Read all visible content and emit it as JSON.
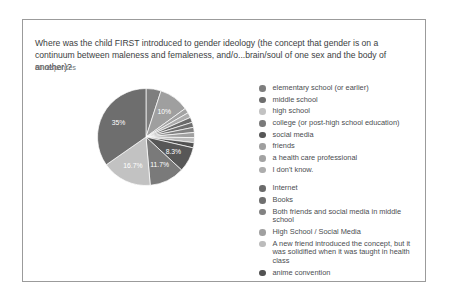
{
  "card": {
    "title_line1": "Where was the child FIRST introduced to gender ideology (the concept that gender is on a",
    "title_line2": "continuum between maleness and femaleness, and/o...brain/soul of one sex and the body of another)?",
    "responses_label": "60 responses"
  },
  "chart_data": {
    "type": "pie",
    "title": "Where was the child FIRST introduced to gender ideology (the concept that gender is on a continuum between maleness and femaleness, and/o...brain/soul of one sex and the body of another)?",
    "n_responses": 60,
    "legend_position": "right",
    "grayscale": true,
    "legend_group_break_index": 8,
    "slices": [
      {
        "label": "elementary school (or earlier)",
        "percent": 5,
        "pct_label": "",
        "color": "#7e7e7e"
      },
      {
        "label": "middle school",
        "percent": 35,
        "pct_label": "35%",
        "color": "#6e6e6e"
      },
      {
        "label": "high school",
        "percent": 16.7,
        "pct_label": "16.7%",
        "color": "#c2c2c2"
      },
      {
        "label": "college (or post-high school education)",
        "percent": 11.7,
        "pct_label": "11.7%",
        "color": "#7a7a7a"
      },
      {
        "label": "social media",
        "percent": 8.3,
        "pct_label": "8.3%",
        "color": "#575757"
      },
      {
        "label": "friends",
        "percent": 10,
        "pct_label": "10%",
        "color": "#9f9f9f"
      },
      {
        "label": "a health care professional",
        "percent": 1.7,
        "pct_label": "",
        "color": "#a3a3a3"
      },
      {
        "label": "I don't know.",
        "percent": 1.7,
        "pct_label": "",
        "color": "#adadad"
      },
      {
        "label": "Internet",
        "percent": 1.7,
        "pct_label": "",
        "color": "#6b6b6b"
      },
      {
        "label": "Books",
        "percent": 1.7,
        "pct_label": "",
        "color": "#6f6f6f"
      },
      {
        "label": "Both friends and social media in middle school",
        "percent": 1.7,
        "pct_label": "",
        "color": "#828282"
      },
      {
        "label": "High School / Social Media",
        "percent": 1.7,
        "pct_label": "",
        "color": "#a0a0a0"
      },
      {
        "label": "A new friend introduced the concept, but it was solidified when it was taught in health class",
        "percent": 1.7,
        "pct_label": "",
        "color": "#bcbcbc"
      },
      {
        "label": "anime convention",
        "percent": 1.7,
        "pct_label": "",
        "color": "#525252"
      }
    ],
    "draw_order": [
      0,
      5,
      6,
      7,
      8,
      9,
      10,
      11,
      12,
      13,
      4,
      3,
      2,
      1
    ]
  }
}
